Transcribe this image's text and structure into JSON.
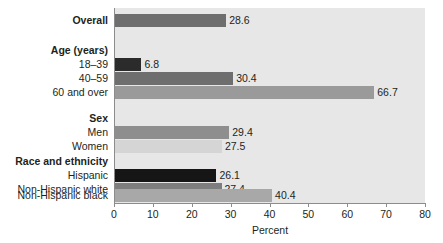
{
  "chart_data": {
    "type": "bar",
    "orientation": "horizontal",
    "title": "",
    "xlabel": "Percent",
    "ylabel": "",
    "xlim": [
      0,
      80
    ],
    "xticks": [
      0,
      10,
      20,
      30,
      40,
      50,
      60,
      70,
      80
    ],
    "grid": false,
    "legend": null,
    "categories": [
      "Overall",
      "Age (years)",
      "18–39",
      "40–59",
      "60 and over",
      "Sex",
      "Men",
      "Women",
      "Race and ethnicity",
      "Hispanic",
      "Non-Hispanic white",
      "Non-Hispanic black"
    ],
    "values": [
      28.6,
      null,
      6.8,
      30.4,
      66.7,
      null,
      29.4,
      27.5,
      null,
      26.1,
      27.4,
      40.4
    ],
    "rows": [
      {
        "label": "Overall",
        "is_group": true,
        "value": 28.6,
        "value_label": "28.6",
        "color": "#6e6e6e"
      },
      {
        "label": "Age (years)",
        "is_group": true,
        "value": null,
        "value_label": "",
        "color": null
      },
      {
        "label": "18–39",
        "is_group": false,
        "value": 6.8,
        "value_label": "6.8",
        "color": "#2b2b2b"
      },
      {
        "label": "40–59",
        "is_group": false,
        "value": 30.4,
        "value_label": "30.4",
        "color": "#6e6e6e"
      },
      {
        "label": "60 and over",
        "is_group": false,
        "value": 66.7,
        "value_label": "66.7",
        "color": "#9a9a9a"
      },
      {
        "label": "Sex",
        "is_group": true,
        "value": null,
        "value_label": "",
        "color": null
      },
      {
        "label": "Men",
        "is_group": false,
        "value": 29.4,
        "value_label": "29.4",
        "color": "#8e8e8e"
      },
      {
        "label": "Women",
        "is_group": false,
        "value": 27.5,
        "value_label": "27.5",
        "color": "#d5d5d5"
      },
      {
        "label": "Race and ethnicity",
        "is_group": true,
        "value": null,
        "value_label": "",
        "color": null
      },
      {
        "label": "Hispanic",
        "is_group": false,
        "value": 26.1,
        "value_label": "26.1",
        "color": "#161616"
      },
      {
        "label": "Non-Hispanic white",
        "is_group": false,
        "value": 27.4,
        "value_label": "27.4",
        "color": "#7e7e7e"
      },
      {
        "label": "Non-Hispanic black",
        "is_group": false,
        "value": 40.4,
        "value_label": "40.4",
        "color": "#a8a8a8"
      }
    ]
  },
  "colors": {
    "plot_background": "#e7e7e7",
    "axis": "#8c8c8c",
    "text": "#231f20"
  }
}
